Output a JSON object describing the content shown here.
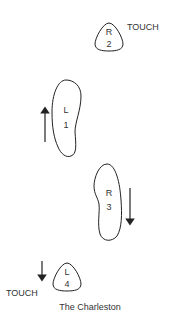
{
  "diagram": {
    "title": "The Charleston",
    "steps": [
      {
        "foot": "R",
        "number": "2",
        "action": "TOUCH",
        "type": "toe"
      },
      {
        "foot": "L",
        "number": "1",
        "action": "",
        "type": "full",
        "direction": "forward"
      },
      {
        "foot": "R",
        "number": "3",
        "action": "",
        "type": "full",
        "direction": "backward"
      },
      {
        "foot": "L",
        "number": "4",
        "action": "TOUCH",
        "type": "toe",
        "direction": "backward"
      }
    ]
  }
}
